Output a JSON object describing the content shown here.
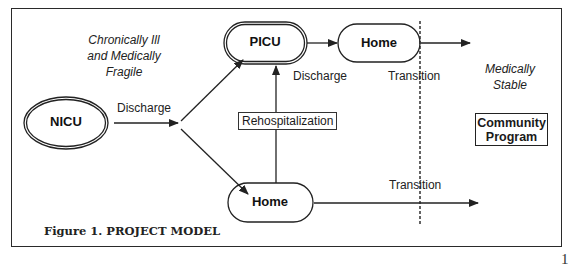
{
  "figure": {
    "caption": "Figure 1. PROJECT MODEL",
    "page_number": "1"
  },
  "nodes": {
    "nicu": {
      "label": "NICU",
      "shape": "double-ellipse"
    },
    "picu": {
      "label": "PICU",
      "shape": "double-rounded-rect"
    },
    "home_top": {
      "label": "Home",
      "shape": "rounded-rect"
    },
    "home_bottom": {
      "label": "Home",
      "shape": "rounded-rect"
    },
    "community_program": {
      "label_line1": "Community",
      "label_line2": "Program",
      "shape": "rect"
    }
  },
  "annotations": {
    "chronically_ill": {
      "line1": "Chronically Ill",
      "line2": "and Medically",
      "line3": "Fragile"
    },
    "medically_stable": {
      "line1": "Medically",
      "line2": "Stable"
    }
  },
  "edges": {
    "nicu_discharge": "Discharge",
    "picu_discharge": "Discharge",
    "rehospitalization": "Rehospitalization",
    "transition_top": "Transition",
    "transition_bottom": "Transition"
  },
  "colors": {
    "stroke": "#222222",
    "background": "#ffffff"
  }
}
